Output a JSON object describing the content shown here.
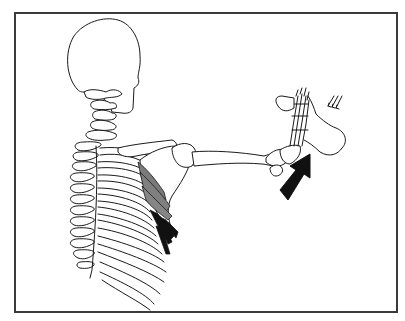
{
  "figure": {
    "highlighted_structure": "serratus-anterior",
    "colors": {
      "line": "#1a1a1a",
      "frame": "#3a3a3a",
      "muscle_upper": "#7a7a7a",
      "muscle_lower": "#111111",
      "arrow": "#111111",
      "background": "#ffffff"
    },
    "arrow_direction": "up-right",
    "force_indicator": "small-arrows-on-examiner-hand"
  }
}
